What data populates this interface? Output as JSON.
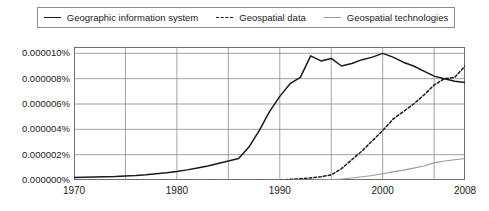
{
  "legend": {
    "position": "top",
    "entries": [
      {
        "label": "Geographic information system",
        "style": "solid-dark",
        "swatch_name": "legend-swatch-solid-dark"
      },
      {
        "label": "Geospatial data",
        "style": "dashed-dark",
        "swatch_name": "legend-swatch-dashed-dark"
      },
      {
        "label": "Geospatial technologies",
        "style": "solid-gray",
        "swatch_name": "legend-swatch-solid-gray"
      }
    ]
  },
  "axes": {
    "y_ticks": [
      "0.000010%",
      "0.000008%",
      "0.000006%",
      "0.000004%",
      "0.000002%",
      "0.000000%"
    ],
    "y_tick_values": [
      1e-05,
      8e-06,
      6e-06,
      4e-06,
      2e-06,
      0.0
    ],
    "x_ticks": [
      "1970",
      "1980",
      "1990",
      "2000",
      "2008"
    ],
    "x_tick_values": [
      1970,
      1980,
      1990,
      2000,
      2008
    ]
  },
  "colors": {
    "gis_line": "#1a1a1a",
    "geospatial_data_line": "#1a1a1a",
    "geospatial_technologies_line": "#9a9a9a",
    "grid": "#8a8a8a",
    "frame": "#6f6f6f",
    "background": "#ffffff",
    "text": "#1a1a1a"
  },
  "chart_data": {
    "type": "line",
    "title": "",
    "subtitle": "",
    "xlabel": "",
    "ylabel": "",
    "xlim": [
      1970,
      2008
    ],
    "ylim": [
      0.0,
      1.05e-05
    ],
    "grid": true,
    "grid_x_values": [
      1970,
      1975,
      1980,
      1985,
      1990,
      1995,
      2000,
      2005
    ],
    "grid_y_values": [
      0.0,
      2e-06,
      4e-06,
      6e-06,
      8e-06,
      1e-05
    ],
    "legend_position": "top",
    "x": [
      1970,
      1971,
      1972,
      1973,
      1974,
      1975,
      1976,
      1977,
      1978,
      1979,
      1980,
      1981,
      1982,
      1983,
      1984,
      1985,
      1986,
      1987,
      1988,
      1989,
      1990,
      1991,
      1992,
      1993,
      1994,
      1995,
      1996,
      1997,
      1998,
      1999,
      2000,
      2001,
      2002,
      2003,
      2004,
      2005,
      2006,
      2007,
      2008
    ],
    "series": [
      {
        "name": "Geographic information system",
        "style": "solid",
        "color": "#1a1a1a",
        "values": [
          2e-07,
          2.2e-07,
          2.4e-07,
          2.6e-07,
          2.8e-07,
          3.2e-07,
          3.6e-07,
          4.2e-07,
          5e-07,
          5.8e-07,
          6.8e-07,
          8e-07,
          9.5e-07,
          1.1e-06,
          1.3e-06,
          1.5e-06,
          1.7e-06,
          2.6e-06,
          3.9e-06,
          5.4e-06,
          6.6e-06,
          7.6e-06,
          8.1e-06,
          9.8e-06,
          9.4e-06,
          9.6e-06,
          9e-06,
          9.2e-06,
          9.5e-06,
          9.7e-06,
          1e-05,
          9.7e-06,
          9.3e-06,
          9e-06,
          8.6e-06,
          8.2e-06,
          8e-06,
          7.8e-06,
          7.7e-06
        ]
      },
      {
        "name": "Geospatial data",
        "style": "dashed",
        "color": "#1a1a1a",
        "values": [
          0.0,
          0.0,
          0.0,
          0.0,
          0.0,
          0.0,
          0.0,
          0.0,
          0.0,
          0.0,
          0.0,
          0.0,
          0.0,
          0.0,
          0.0,
          0.0,
          0.0,
          0.0,
          0.0,
          0.0,
          0.0,
          5e-08,
          1e-07,
          1.6e-07,
          2.6e-07,
          4e-07,
          9e-07,
          1.6e-06,
          2.3e-06,
          3.1e-06,
          3.9e-06,
          4.8e-06,
          5.4e-06,
          6e-06,
          6.7e-06,
          7.5e-06,
          8e-06,
          8.1e-06,
          9e-06
        ]
      },
      {
        "name": "Geospatial technologies",
        "style": "solid",
        "color": "#9a9a9a",
        "values": [
          0.0,
          0.0,
          0.0,
          0.0,
          0.0,
          0.0,
          0.0,
          0.0,
          0.0,
          0.0,
          0.0,
          0.0,
          0.0,
          0.0,
          0.0,
          0.0,
          0.0,
          0.0,
          0.0,
          0.0,
          0.0,
          0.0,
          0.0,
          0.0,
          0.0,
          3e-08,
          8e-08,
          1.6e-07,
          2.6e-07,
          3.6e-07,
          5e-07,
          6.4e-07,
          7.8e-07,
          9.4e-07,
          1.1e-06,
          1.35e-06,
          1.5e-06,
          1.6e-06,
          1.7e-06
        ]
      }
    ]
  }
}
